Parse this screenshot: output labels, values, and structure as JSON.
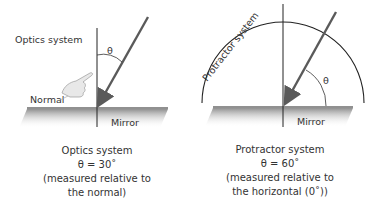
{
  "left_panel": {
    "system_label": "Optics system",
    "angle_symbol": "θ",
    "normal_label": "Normal",
    "mirror_label": "Mirror",
    "caption": {
      "line1": "Optics system",
      "line2": "θ = 30˚",
      "line3": "(measured relative to",
      "line4": "the normal)"
    }
  },
  "right_panel": {
    "system_label": "Protractor system",
    "angle_symbol": "θ",
    "mirror_label": "Mirror",
    "caption": {
      "line1": "Protractor system",
      "line2": "θ = 60˚",
      "line3": "(measured relative to",
      "line4": "the horizontal (0˚))"
    }
  },
  "colors": {
    "ray": "#5a5a5a",
    "line": "#222222",
    "mirror_shade": "#9a9a9a"
  }
}
